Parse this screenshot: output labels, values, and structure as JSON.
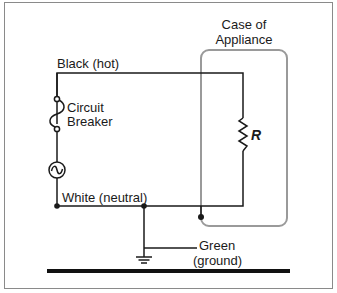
{
  "diagram": {
    "type": "circuit-schematic",
    "labels": {
      "hot_wire": "Black (hot)",
      "breaker_line1": "Circuit",
      "breaker_line2": "Breaker",
      "neutral_wire": "White (neutral)",
      "case_line1": "Case of",
      "case_line2": "Appliance",
      "resistor": "R",
      "ground_line1": "Green",
      "ground_line2": "(ground)"
    },
    "components": [
      {
        "name": "circuit-breaker",
        "label": "Circuit Breaker"
      },
      {
        "name": "ac-source",
        "symbol": "~"
      },
      {
        "name": "resistor",
        "label": "R"
      },
      {
        "name": "appliance-case",
        "label": "Case of Appliance"
      },
      {
        "name": "ground-symbol"
      },
      {
        "name": "earth-ground-bar"
      }
    ],
    "colors": {
      "wire": "#1a1a1a",
      "case_outline": "#9a9a9a",
      "frame": "#8a8a8a",
      "ground_bar": "#111111"
    }
  }
}
